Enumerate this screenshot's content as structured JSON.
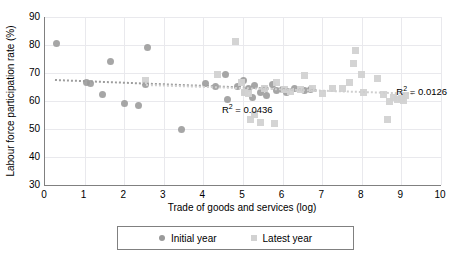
{
  "chart_data": {
    "type": "scatter",
    "title": "",
    "xlabel": "Trade of goods and services (log)",
    "ylabel": "Labour force participation rate (%)",
    "xlim": [
      0,
      10
    ],
    "ylim": [
      30,
      90
    ],
    "xticks": [
      0,
      1,
      2,
      3,
      4,
      5,
      6,
      7,
      8,
      9,
      10
    ],
    "yticks": [
      30,
      40,
      50,
      60,
      70,
      80,
      90
    ],
    "grid": true,
    "legend_position": "bottom",
    "series": [
      {
        "name": "Initial year",
        "marker": "circle",
        "color": "#9a9a9a",
        "points": [
          [
            0.3,
            80.5
          ],
          [
            1.05,
            66.5
          ],
          [
            1.15,
            66.3
          ],
          [
            1.45,
            62.2
          ],
          [
            1.65,
            74.0
          ],
          [
            2.0,
            59.2
          ],
          [
            2.35,
            58.4
          ],
          [
            2.55,
            65.8
          ],
          [
            2.6,
            79.0
          ],
          [
            3.45,
            50.0
          ],
          [
            4.05,
            66.4
          ],
          [
            4.3,
            65.3
          ],
          [
            4.55,
            69.3
          ],
          [
            4.6,
            60.5
          ],
          [
            4.85,
            65.2
          ],
          [
            5.0,
            67.4
          ],
          [
            5.05,
            63.0
          ],
          [
            5.15,
            64.5
          ],
          [
            5.25,
            61.3
          ],
          [
            5.3,
            65.5
          ],
          [
            5.45,
            63.2
          ],
          [
            5.55,
            64.6
          ],
          [
            5.6,
            62.0
          ],
          [
            5.75,
            66.0
          ],
          [
            5.85,
            63.7
          ],
          [
            6.0,
            64.2
          ],
          [
            6.1,
            63.2
          ],
          [
            6.3,
            64.3
          ],
          [
            6.55,
            63.9
          ],
          [
            6.7,
            64.0
          ]
        ]
      },
      {
        "name": "Latest year",
        "marker": "square",
        "color": "#d2d2d2",
        "points": [
          [
            2.55,
            67.3
          ],
          [
            4.35,
            69.5
          ],
          [
            4.8,
            81.3
          ],
          [
            4.95,
            66.5
          ],
          [
            5.05,
            63.2
          ],
          [
            5.15,
            62.8
          ],
          [
            5.2,
            53.3
          ],
          [
            5.3,
            55.2
          ],
          [
            5.45,
            52.3
          ],
          [
            5.55,
            64.5
          ],
          [
            5.8,
            52.0
          ],
          [
            5.85,
            66.5
          ],
          [
            6.05,
            64.0
          ],
          [
            6.2,
            63.5
          ],
          [
            6.45,
            64.0
          ],
          [
            6.55,
            69.0
          ],
          [
            6.75,
            64.3
          ],
          [
            7.0,
            62.8
          ],
          [
            7.25,
            64.6
          ],
          [
            7.5,
            64.3
          ],
          [
            7.7,
            66.5
          ],
          [
            7.8,
            73.5
          ],
          [
            7.85,
            78.0
          ],
          [
            8.0,
            69.5
          ],
          [
            8.05,
            63.2
          ],
          [
            8.4,
            68.0
          ],
          [
            8.55,
            62.4
          ],
          [
            8.65,
            53.5
          ],
          [
            8.7,
            60.0
          ],
          [
            8.8,
            61.3
          ],
          [
            8.9,
            60.5
          ],
          [
            9.0,
            61.0
          ],
          [
            9.05,
            60.2
          ],
          [
            9.1,
            61.8
          ]
        ]
      }
    ],
    "trendlines": [
      {
        "name": "Initial year trend",
        "style": "dotted",
        "color": "#9d9d9d",
        "x0": 0.25,
        "y0": 67.7,
        "x1": 6.85,
        "y1": 64.0,
        "r2_label": "R² = 0.0436",
        "r2_value": 0.0436
      },
      {
        "name": "Latest year trend",
        "style": "dotted",
        "color": "#cfcfcf",
        "x0": 2.55,
        "y0": 66.2,
        "x1": 9.3,
        "y1": 63.1,
        "r2_label": "R² = 0.0126",
        "r2_value": 0.0126
      }
    ],
    "annotations": [
      {
        "text_base": "R",
        "text_sup": "2",
        "text_rest": " = 0.0436",
        "x": 5.2,
        "y": 57.5
      },
      {
        "text_base": "R",
        "text_sup": "2",
        "text_rest": " = 0.0126",
        "x": 9.1,
        "y": 63.8
      }
    ]
  },
  "legend": {
    "entries": [
      {
        "label": "Initial year",
        "marker": "circle-marker-icon"
      },
      {
        "label": "Latest year",
        "marker": "square-marker-icon"
      }
    ]
  },
  "axes": {
    "y_title": "Labour force participation rate (%)",
    "x_title": "Trade of goods and services (log)",
    "y_tick_labels": [
      "90",
      "80",
      "70",
      "60",
      "50",
      "40",
      "30"
    ],
    "x_tick_labels": [
      "0",
      "1",
      "2",
      "3",
      "4",
      "5",
      "6",
      "7",
      "8",
      "9",
      "10"
    ]
  },
  "annotations": {
    "r2_initial_prefix": "R",
    "r2_initial_sup": "2",
    "r2_initial_suffix": " = 0.0436",
    "r2_latest_prefix": "R",
    "r2_latest_sup": "2",
    "r2_latest_suffix": " = 0.0126"
  }
}
